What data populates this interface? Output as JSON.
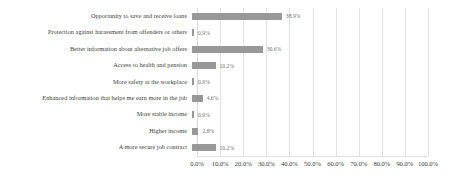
{
  "chart_data": {
    "type": "bar",
    "orientation": "horizontal",
    "title": "",
    "subtitle": "",
    "xlabel": "",
    "ylabel": "",
    "xlim": [
      0,
      100
    ],
    "grid": true,
    "legend": false,
    "legend_position": "none",
    "unit": "%",
    "bar_color": "#989898",
    "gridline_color": "#e3e3e3",
    "text_color": "#3c3c3c",
    "value_label_color": "#6e6e6e",
    "categories": [
      "Opportunity to save and receive loans",
      "Protection against harassment from offenders or others",
      "Better information about alternative job offers",
      "Access to health and pension",
      "More safety at the workplace",
      "Enhanced information that helps me earn more in the job",
      "More stable income",
      "Higher income",
      "A more secure job contract"
    ],
    "values": [
      38.9,
      0.9,
      30.6,
      10.2,
      0.9,
      4.6,
      0.9,
      2.8,
      10.2
    ],
    "value_labels": [
      "38.9%",
      "0.9%",
      "30.6%",
      "10.2%",
      "0.9%",
      "4.6%",
      "0.9%",
      "2.8%",
      "10.2%"
    ],
    "xticks": [
      0,
      10,
      20,
      30,
      40,
      50,
      60,
      70,
      80,
      90,
      100
    ],
    "xticklabels": [
      "0.0%",
      "10.0%",
      "20.0%",
      "30.0%",
      "40.0%",
      "50.0%",
      "60.0%",
      "70.0%",
      "80.0%",
      "90.0%",
      "100.0%"
    ]
  }
}
